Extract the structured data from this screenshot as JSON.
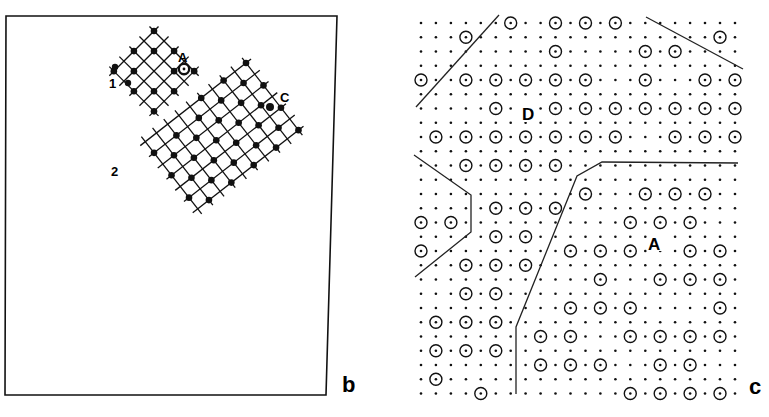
{
  "figure": {
    "panels": [
      {
        "id": "b",
        "label": "b",
        "description": "Rectangular frame containing two rotated square lattice grids (grain 1 and grain 2) with occupied sites marked by filled dots",
        "grain_labels": [
          "1",
          "2"
        ],
        "site_labels": [
          "A",
          "C"
        ]
      },
      {
        "id": "c",
        "label": "c",
        "description": "Square lattice of dots with circled sites; domain boundaries drawn as lines",
        "domain_labels": [
          "D",
          "A"
        ]
      }
    ],
    "panel_b": {
      "label": "b",
      "grain1_label": "1",
      "grain2_label": "2",
      "site_A_label": "A",
      "site_C_label": "C"
    },
    "panel_c": {
      "label": "c",
      "domain_D_label": "D",
      "domain_A_label": "A",
      "grid": {
        "cols": 22,
        "rows": 27,
        "x0": 421,
        "dx": 14.95,
        "y0": 23,
        "dy": 14.25
      },
      "circled_sites": [
        [
          0,
          [
            6,
            9,
            11,
            13
          ]
        ],
        [
          1,
          [
            3,
            20
          ]
        ],
        [
          2,
          [
            9,
            15,
            17
          ]
        ],
        [
          4,
          [
            0,
            3,
            5,
            7,
            9,
            11,
            15,
            19,
            21
          ]
        ],
        [
          6,
          [
            5,
            9,
            11,
            13,
            15,
            17,
            19,
            21
          ]
        ],
        [
          8,
          [
            1,
            3,
            5,
            7,
            9,
            11,
            13,
            17,
            19,
            21
          ]
        ],
        [
          10,
          [
            3,
            5,
            7,
            9
          ]
        ],
        [
          12,
          [
            11,
            15,
            17,
            19
          ]
        ],
        [
          13,
          [
            5,
            7,
            9
          ]
        ],
        [
          14,
          [
            0,
            2,
            14,
            16,
            18
          ]
        ],
        [
          15,
          [
            5,
            7
          ]
        ],
        [
          16,
          [
            0,
            10,
            12,
            14,
            18,
            20
          ]
        ],
        [
          17,
          [
            3,
            5,
            7
          ]
        ],
        [
          18,
          [
            12,
            16,
            18,
            20
          ]
        ],
        [
          19,
          [
            3,
            5
          ]
        ],
        [
          20,
          [
            10,
            12,
            14,
            20
          ]
        ],
        [
          21,
          [
            1,
            3,
            5
          ]
        ],
        [
          22,
          [
            8,
            10,
            14,
            16,
            18,
            20
          ]
        ],
        [
          23,
          [
            1,
            3,
            5
          ]
        ],
        [
          24,
          [
            8,
            10,
            12,
            16,
            18
          ]
        ],
        [
          25,
          [
            1
          ]
        ],
        [
          26,
          [
            4,
            14,
            16,
            18,
            20
          ]
        ]
      ]
    }
  }
}
